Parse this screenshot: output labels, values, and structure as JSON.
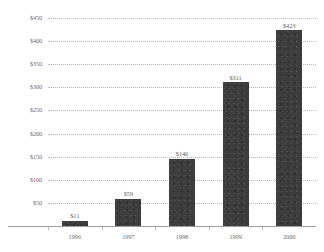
{
  "chart_data": {
    "type": "bar",
    "title": "",
    "subtitle": "",
    "xlabel": "",
    "ylabel": "",
    "categories": [
      "1996",
      "1997",
      "1998",
      "1999",
      "2000"
    ],
    "values": [
      11,
      59,
      146,
      311,
      423
    ],
    "point_labels": [
      "$11",
      "$59",
      "$146",
      "$311",
      "$423"
    ],
    "ylim": [
      0,
      450
    ],
    "ytick_values": [
      50,
      100,
      150,
      200,
      250,
      300,
      350,
      400,
      450
    ],
    "ytick_labels": [
      "$50",
      "$100",
      "$150",
      "$200",
      "$250",
      "$300",
      "$350",
      "$400",
      "$450"
    ],
    "grid": true,
    "grid_style": "dotted",
    "legend": false,
    "legend_position": "none",
    "series": [
      {
        "name": "",
        "values": [
          11,
          59,
          146,
          311,
          423
        ]
      }
    ],
    "colors": {
      "bar": "#3c3c3c",
      "gridline": "#b9b9b9",
      "axis": "#9d9d9d",
      "tick_text": "#6d6d6d",
      "value_text": "#5f5f5f",
      "background": "#ffffff"
    }
  }
}
